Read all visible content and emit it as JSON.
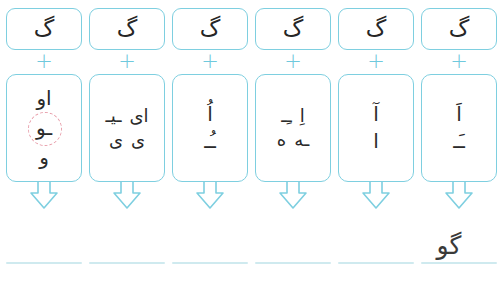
{
  "worksheet": {
    "title": "Persian syllable building worksheet",
    "operator_symbol": "+",
    "accent_color": "#7ecfe0",
    "highlight_color": "#e8a0ac",
    "ink_color": "#262626",
    "line_color": "#cfeaef",
    "columns": [
      {
        "id": "column-1",
        "consonant": "گ",
        "operator": "+",
        "vowel_rows": [
          {
            "cells": [
              "اَ"
            ]
          },
          {
            "cells": [
              "ـَـ"
            ]
          }
        ],
        "arrow": "arrow-down",
        "answer": ""
      },
      {
        "id": "column-2",
        "consonant": "گ",
        "operator": "+",
        "vowel_rows": [
          {
            "cells": [
              "آ"
            ]
          },
          {
            "cells": [
              "ا"
            ]
          }
        ],
        "arrow": "arrow-down",
        "answer": ""
      },
      {
        "id": "column-3",
        "consonant": "گ",
        "operator": "+",
        "vowel_rows": [
          {
            "cells": [
              "اِ",
              "ـِـ"
            ]
          },
          {
            "cells": [
              "ـه",
              "ه"
            ]
          }
        ],
        "arrow": "arrow-down",
        "answer": ""
      },
      {
        "id": "column-4",
        "consonant": "گ",
        "operator": "+",
        "vowel_rows": [
          {
            "cells": [
              "اُ"
            ]
          },
          {
            "cells": [
              "ـُـ"
            ]
          }
        ],
        "arrow": "arrow-down",
        "answer": ""
      },
      {
        "id": "column-5",
        "consonant": "گ",
        "operator": "+",
        "vowel_rows": [
          {
            "cells": [
              "ای",
              "ـیـ"
            ]
          },
          {
            "cells": [
              "ی",
              "ی"
            ]
          }
        ],
        "arrow": "arrow-down",
        "answer": ""
      },
      {
        "id": "column-6",
        "consonant": "گ",
        "operator": "+",
        "vowel_rows": [
          {
            "cells": [
              "او"
            ]
          },
          {
            "cells": [
              "ـو"
            ],
            "circled": true
          },
          {
            "cells": [
              "و"
            ]
          }
        ],
        "arrow": "arrow-down",
        "answer": "گو"
      }
    ]
  }
}
